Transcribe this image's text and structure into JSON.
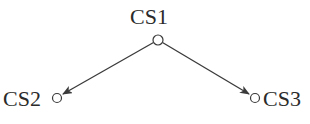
{
  "diagram": {
    "type": "directed-tree",
    "nodes": [
      {
        "id": "CS1",
        "label": "CS1",
        "x": 158,
        "y": 40,
        "r": 5
      },
      {
        "id": "CS2",
        "label": "CS2",
        "x": 57,
        "y": 98,
        "r": 4.5
      },
      {
        "id": "CS3",
        "label": "CS3",
        "x": 255,
        "y": 98,
        "r": 4.5
      }
    ],
    "edges": [
      {
        "from": "CS1",
        "to": "CS2",
        "directed": true
      },
      {
        "from": "CS1",
        "to": "CS3",
        "directed": true
      }
    ],
    "colors": {
      "stroke": "#3a3a3a",
      "text": "#2b2b2b",
      "background": "#ffffff"
    }
  },
  "labels": {
    "cs1": "CS1",
    "cs2": "CS2",
    "cs3": "CS3"
  }
}
